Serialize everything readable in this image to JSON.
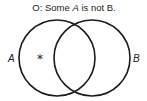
{
  "diagram": {
    "type": "venn",
    "title": {
      "prefix": "O:",
      "word1": " Some ",
      "term_a": "A",
      "word2": " is not ",
      "term_b": "B."
    },
    "sets": [
      {
        "label": "A",
        "cx": 57,
        "cy": 58,
        "r": 38
      },
      {
        "label": "B",
        "cx": 92,
        "cy": 58,
        "r": 38
      }
    ],
    "marks": [
      {
        "symbol": "*",
        "region": "A only",
        "x": 40,
        "y": 58
      }
    ],
    "colors": {
      "stroke": "#1a1a1a",
      "text": "#222222",
      "background": "#ffffff"
    }
  }
}
